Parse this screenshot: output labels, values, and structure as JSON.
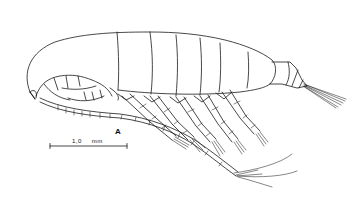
{
  "figure": {
    "panel_label": "A",
    "scale_bar": {
      "value": "1,0",
      "unit": "mm"
    },
    "line_color": "#1a1a1a",
    "background_color": "#ffffff"
  }
}
